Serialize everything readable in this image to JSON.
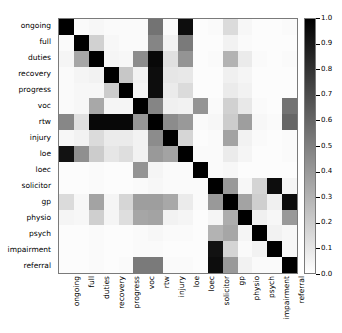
{
  "chart_data": {
    "type": "heatmap",
    "title": "",
    "xlabel": "",
    "ylabel": "",
    "colormap": "gray_r",
    "grid": false,
    "legend_position": "right",
    "colorbar": {
      "label": "",
      "vmin": 0.0,
      "vmax": 1.0,
      "ticks": [
        "1.0",
        "0.9",
        "0.8",
        "0.7",
        "0.6",
        "0.5",
        "0.4",
        "0.3",
        "0.2",
        "0.1",
        "0.0"
      ],
      "tick_values": [
        1.0,
        0.9,
        0.8,
        0.7,
        0.6,
        0.5,
        0.4,
        0.3,
        0.2,
        0.1,
        0.0
      ],
      "orientation": "vertical"
    },
    "categories": [
      "ongoing",
      "full",
      "duties",
      "recovery",
      "progress",
      "voc",
      "rtw",
      "injury",
      "loe",
      "loec",
      "solicitor",
      "gp",
      "physio",
      "psych",
      "impairment",
      "referral"
    ],
    "x_tick_labels": [
      "ongoing",
      "full",
      "duties",
      "recovery",
      "progress",
      "voc",
      "rtw",
      "injury",
      "loe",
      "loec",
      "solicitor",
      "gp",
      "physio",
      "psych",
      "impairment",
      "referral"
    ],
    "y_tick_labels": [
      "ongoing",
      "full",
      "duties",
      "recovery",
      "progress",
      "voc",
      "rtw",
      "injury",
      "loe",
      "loec",
      "solicitor",
      "gp",
      "physio",
      "psych",
      "impairment",
      "referral"
    ],
    "matrix": [
      [
        1.0,
        0.02,
        0.03,
        0.02,
        0.02,
        0.02,
        0.55,
        0.02,
        0.95,
        0.01,
        0.02,
        0.14,
        0.03,
        0.01,
        0.01,
        0.02
      ],
      [
        0.02,
        1.0,
        0.18,
        0.03,
        0.02,
        0.02,
        0.48,
        0.05,
        0.52,
        0.01,
        0.01,
        0.05,
        0.02,
        0.01,
        0.01,
        0.01
      ],
      [
        0.04,
        0.35,
        1.0,
        0.04,
        0.03,
        0.45,
        0.97,
        0.12,
        0.42,
        0.01,
        0.02,
        0.3,
        0.08,
        0.02,
        0.01,
        0.02
      ],
      [
        0.02,
        0.04,
        0.05,
        1.0,
        0.22,
        0.05,
        0.95,
        0.1,
        0.09,
        0.01,
        0.01,
        0.06,
        0.04,
        0.01,
        0.01,
        0.01
      ],
      [
        0.02,
        0.03,
        0.03,
        0.2,
        1.0,
        0.04,
        0.95,
        0.08,
        0.14,
        0.01,
        0.01,
        0.08,
        0.05,
        0.01,
        0.01,
        0.01
      ],
      [
        0.02,
        0.03,
        0.34,
        0.04,
        0.04,
        1.0,
        0.48,
        0.06,
        0.05,
        0.42,
        0.02,
        0.18,
        0.09,
        0.02,
        0.01,
        0.55
      ],
      [
        0.47,
        0.12,
        0.97,
        0.97,
        0.97,
        0.41,
        1.0,
        0.45,
        0.4,
        0.02,
        0.03,
        0.2,
        0.38,
        0.03,
        0.02,
        0.6
      ],
      [
        0.03,
        0.05,
        0.14,
        0.08,
        0.08,
        0.05,
        0.45,
        1.0,
        0.16,
        0.01,
        0.02,
        0.36,
        0.05,
        0.02,
        0.01,
        0.02
      ],
      [
        0.93,
        0.44,
        0.2,
        0.1,
        0.13,
        0.05,
        0.4,
        0.36,
        1.0,
        0.02,
        0.02,
        0.08,
        0.04,
        0.01,
        0.01,
        0.02
      ],
      [
        0.01,
        0.01,
        0.02,
        0.01,
        0.01,
        0.42,
        0.04,
        0.02,
        0.02,
        1.0,
        0.02,
        0.03,
        0.01,
        0.01,
        0.01,
        0.01
      ],
      [
        0.01,
        0.01,
        0.02,
        0.01,
        0.01,
        0.02,
        0.03,
        0.02,
        0.02,
        0.02,
        1.0,
        0.4,
        0.03,
        0.17,
        0.95,
        0.04
      ],
      [
        0.14,
        0.03,
        0.36,
        0.04,
        0.16,
        0.38,
        0.38,
        0.34,
        0.08,
        0.02,
        0.4,
        1.0,
        0.36,
        0.19,
        0.06,
        0.95
      ],
      [
        0.04,
        0.03,
        0.19,
        0.04,
        0.13,
        0.35,
        0.36,
        0.05,
        0.04,
        0.01,
        0.04,
        0.32,
        1.0,
        0.06,
        0.03,
        0.4
      ],
      [
        0.01,
        0.01,
        0.02,
        0.01,
        0.01,
        0.02,
        0.03,
        0.02,
        0.02,
        0.01,
        0.3,
        0.35,
        0.04,
        1.0,
        0.05,
        0.03
      ],
      [
        0.01,
        0.01,
        0.02,
        0.01,
        0.01,
        0.02,
        0.02,
        0.01,
        0.01,
        0.01,
        0.93,
        0.17,
        0.02,
        0.05,
        1.0,
        0.03
      ],
      [
        0.01,
        0.01,
        0.02,
        0.01,
        0.02,
        0.52,
        0.52,
        0.02,
        0.02,
        0.01,
        0.95,
        0.4,
        0.05,
        0.02,
        0.02,
        1.0
      ]
    ]
  }
}
